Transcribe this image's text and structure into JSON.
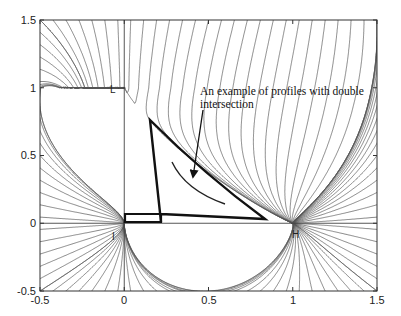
{
  "chart_data": {
    "type": "line",
    "subtype": "phase-portrait-streamlines",
    "title": "",
    "xlabel": "",
    "ylabel": "",
    "xlim": [
      -0.5,
      1.5
    ],
    "ylim": [
      -0.5,
      1.5
    ],
    "grid": false,
    "legend": null,
    "x_ticks": [
      -0.5,
      0,
      0.5,
      1,
      1.5
    ],
    "x_tick_labels": [
      "-0.5",
      "0",
      "0.5",
      "1",
      "1.5"
    ],
    "y_ticks": [
      -0.5,
      0,
      0.5,
      1,
      1.5
    ],
    "y_tick_labels": [
      "-0.5",
      "0",
      "0.5",
      "1",
      "1.5"
    ],
    "critical_points": [
      {
        "label": "L",
        "x": 0,
        "y": 1,
        "kind": "node"
      },
      {
        "label": "I",
        "x": 0,
        "y": 0,
        "kind": "saddle"
      },
      {
        "label": "H",
        "x": 1,
        "y": 0,
        "kind": "node"
      }
    ],
    "highlighted_profile": {
      "description": "thick closed profile",
      "points": [
        [
          0.0,
          0.05
        ],
        [
          0.22,
          0.05
        ],
        [
          0.15,
          0.77
        ],
        [
          0.42,
          0.35
        ],
        [
          0.83,
          0.03
        ],
        [
          0.0,
          0.03
        ]
      ]
    },
    "annotations": [
      {
        "text": "An example of profiles with double intersection",
        "line1": "An example of profiles with double",
        "line2": "intersection",
        "x": 0.47,
        "y": 0.86,
        "arrow_to": [
          0.4,
          0.32
        ]
      }
    ]
  },
  "axes": {
    "x_labels": [
      "-0.5",
      "0",
      "0.5",
      "1",
      "1.5"
    ],
    "y_labels": [
      "-0.5",
      "0",
      "0.5",
      "1",
      "1.5"
    ]
  },
  "labels": {
    "L": "L",
    "I": "I",
    "H": "H",
    "annotation_line1": "An example of profiles with double",
    "annotation_line2": "intersection"
  },
  "colors": {
    "stream": "#555555",
    "frame": "#333333",
    "profile": "#111111",
    "background": "#ffffff"
  }
}
